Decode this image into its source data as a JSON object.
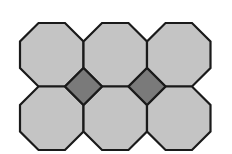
{
  "diagram": {
    "colors": {
      "octagon_fill": "#c4c4c4",
      "square_fill": "#7a7a7a",
      "stroke": "#1a1a1a",
      "background": "#ffffff"
    },
    "grid": {
      "rows": 2,
      "cols": 3,
      "origin_x": 20,
      "origin_y": 23,
      "cell": 63.5,
      "cut": 18.5
    },
    "octagons": [
      {
        "row": 0,
        "col": 0
      },
      {
        "row": 0,
        "col": 1
      },
      {
        "row": 0,
        "col": 2
      },
      {
        "row": 1,
        "col": 0
      },
      {
        "row": 1,
        "col": 1
      },
      {
        "row": 1,
        "col": 2
      }
    ],
    "squares": [
      {
        "cx": 83.5,
        "cy": 86.5
      },
      {
        "cx": 147,
        "cy": 86.5
      }
    ]
  }
}
